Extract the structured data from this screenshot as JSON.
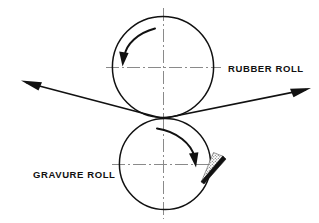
{
  "diagram": {
    "background_color": "#ffffff",
    "line_color": "#111111",
    "centerline_color": "#8a8a8a",
    "width": 319,
    "height": 223
  },
  "labels": {
    "rubber_roll": "RUBBER ROLL",
    "gravure_roll": "GRAVURE ROLL"
  },
  "rolls": [
    {
      "id": "rubber-roll",
      "label": "RUBBER ROLL",
      "center_x": 163,
      "center_y": 67,
      "radius": 51,
      "rotation": "clockwise"
    },
    {
      "id": "gravure-roll",
      "label": "GRAVURE ROLL",
      "center_x": 165,
      "center_y": 164,
      "radius": 46,
      "rotation": "clockwise"
    }
  ],
  "nip": {
    "x": 163,
    "y": 118
  },
  "web": {
    "entry_arrow_label": "web-in",
    "exit_arrow_label": "web-out",
    "entry_tip_x": 21,
    "entry_tip_y": 81,
    "exit_tip_x": 311,
    "exit_tip_y": 88
  },
  "doctor_blade": {
    "id": "doctor-blade",
    "fill_style": "stippled",
    "contact_x": 201,
    "contact_y": 181
  }
}
